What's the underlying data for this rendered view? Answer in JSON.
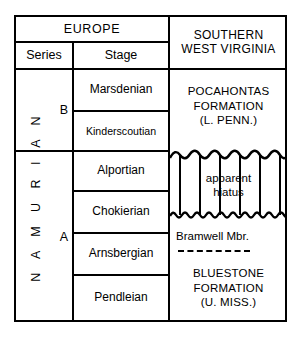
{
  "figure": {
    "kind": "stratigraphic-correlation-chart"
  },
  "header": {
    "europe": "EUROPE",
    "series": "Series",
    "stage": "Stage",
    "region_line1": "SOUTHERN",
    "region_line2": "WEST VIRGINIA"
  },
  "europe": {
    "series_name": "N A M U R I A N",
    "subdivisions": [
      {
        "label": "B"
      },
      {
        "label": "A"
      }
    ],
    "stages": [
      {
        "name": "Marsdenian"
      },
      {
        "name": "Kinderscoutian"
      },
      {
        "name": "Alportian"
      },
      {
        "name": "Chokierian"
      },
      {
        "name": "Arnsbergian"
      },
      {
        "name": "Pendleian"
      }
    ]
  },
  "west_virginia": {
    "pocahontas": {
      "line1": "POCAHONTAS",
      "line2": "FORMATION",
      "line3": "(L. PENN.)"
    },
    "hiatus": {
      "line1": "apparent",
      "line2": "hiatus"
    },
    "bramwell": "Bramwell Mbr.",
    "bluestone": {
      "line1": "BLUESTONE",
      "line2": "FORMATION",
      "line3": "(U. MISS.)"
    }
  },
  "colors": {
    "ink": "#000000",
    "paper": "#ffffff"
  }
}
